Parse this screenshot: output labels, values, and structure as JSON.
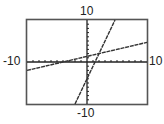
{
  "window": {
    "xmin_label": "-10",
    "xmax_label": "10",
    "ymin_label": "-10",
    "ymax_label": "10"
  },
  "colors": {
    "frame": "#555555",
    "axis": "#222222",
    "line": "#333333",
    "background": "#ffffff"
  },
  "chart_data": {
    "type": "line",
    "title": "",
    "xlabel": "",
    "ylabel": "",
    "xlim": [
      -10,
      10
    ],
    "ylim": [
      -10,
      10
    ],
    "xscale_tick": 1,
    "yscale_tick": 1,
    "grid": false,
    "legend": null,
    "tick_labels": {
      "left": "-10",
      "right": "10",
      "top": "10",
      "bottom": "-10"
    },
    "series": [
      {
        "name": "steep line",
        "equation": "y = 3x - 4",
        "slope": 3,
        "intercept": -4,
        "x": [
          -2,
          4.67
        ],
        "y": [
          -10,
          10
        ]
      },
      {
        "name": "shallow line",
        "equation": "y = x/3 + 4/3",
        "slope": 0.333,
        "intercept": 1.333,
        "x": [
          -10,
          10
        ],
        "y": [
          -2,
          4.67
        ]
      }
    ],
    "annotations": [
      {
        "type": "intersection",
        "x": 2,
        "y": 2
      }
    ]
  }
}
